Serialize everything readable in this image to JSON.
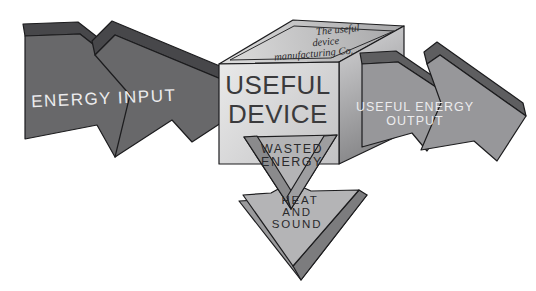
{
  "colors": {
    "background": "#ffffff",
    "outline": "#1c1c1e",
    "input_face": "#68686a",
    "input_bevel": "#47474a",
    "output_face": "#97979a",
    "output_bevel": "#5e5e60",
    "box_front_light": "#e9e9e9",
    "box_front_dark": "#c2c2c4",
    "box_top_light": "#dcdcdc",
    "box_top_dark": "#a6a6a8",
    "box_right_light": "#c6c6c8",
    "box_right_dark": "#7d7d7f",
    "wasted_face": "#b4b4b6",
    "wasted_bevel_left": "#8a8a8c",
    "wasted_bevel_right": "#9e9ea0",
    "heat_face": "#b4b4b6",
    "heat_rim": "#9a9a9c",
    "heat_rim_dark": "#7c7c7e",
    "text_light": "#ececee",
    "text_dark": "#2a2a2c",
    "device_text": "#3a3a3c"
  },
  "arrows": {
    "input": {
      "label": "ENERGY INPUT"
    },
    "output": {
      "line1": "USEFUL ENERGY",
      "line2": "OUTPUT"
    },
    "wasted": {
      "line1": "WASTED",
      "line2": "ENERGY"
    },
    "heat": {
      "line1": "HEAT",
      "line2": "AND",
      "line3": "SOUND"
    }
  },
  "device_box": {
    "front": {
      "line1": "USEFUL",
      "line2": "DEVICE"
    },
    "top_plate": {
      "line1": "The useful",
      "line2": "device",
      "line3": "manufacturing Co."
    }
  }
}
